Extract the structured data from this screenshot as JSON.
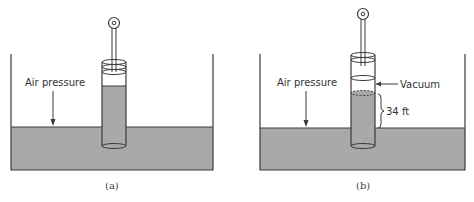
{
  "figure": {
    "panels": [
      {
        "id": "a",
        "caption": "(a)",
        "labels": {
          "air_pressure": "Air pressure"
        }
      },
      {
        "id": "b",
        "caption": "(b)",
        "labels": {
          "air_pressure": "Air pressure",
          "vacuum": "Vacuum",
          "height": "34 ft"
        }
      }
    ],
    "colors": {
      "water": "#a9a9a9",
      "line": "#3a3a3a",
      "background": "#ffffff"
    }
  }
}
